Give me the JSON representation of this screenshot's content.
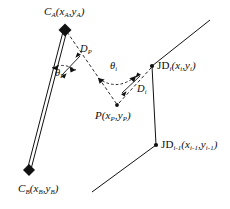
{
  "figure": {
    "type": "geometry-diagram",
    "background_color": "#ffffff",
    "stroke_color": "#111111",
    "labels": {
      "c_a": {
        "symbol": "C",
        "sub": "A",
        "coords": "(x",
        "coord_sub_1": "A",
        "coord_mid": ", y",
        "coord_sub_2": "A",
        "coord_close": ")"
      },
      "c_b": {
        "symbol": "C",
        "sub": "B"
      },
      "p": {
        "symbol": "P",
        "sub": "P"
      },
      "jd_i": {
        "prefix": "JD",
        "sub": "i"
      },
      "jd_i_minus_1": {
        "prefix": "JD",
        "sub": "i-1"
      },
      "d_p": {
        "symbol": "D",
        "sub": "P"
      },
      "d_i": {
        "symbol": "D",
        "sub": "i"
      },
      "theta_p": {
        "symbol": "θ",
        "sub": "P"
      },
      "theta_i": {
        "symbol": "θ",
        "sub": "i"
      }
    },
    "text": {
      "c_a_main": "C",
      "c_a_sub": "A",
      "c_a_open": "(x",
      "c_a_xsub": "A",
      "c_a_comma": ",y",
      "c_a_ysub": "A",
      "c_a_close": ")",
      "c_b_main": "C",
      "c_b_sub": "B",
      "c_b_open": "(x",
      "c_b_xsub": "B",
      "c_b_comma": ",y",
      "c_b_ysub": "B",
      "c_b_close": ")",
      "p_main": "P",
      "p_open": "(x",
      "p_xsub": "P",
      "p_comma": ",y",
      "p_ysub": "P",
      "p_close": ")",
      "jdi_main": "JD",
      "jdi_sub": "i",
      "jdi_open": "(x",
      "jdi_xsub": "i",
      "jdi_comma": ",y",
      "jdi_ysub": "i",
      "jdi_close": ")",
      "jdim1_main": "JD",
      "jdim1_sub": "i-1",
      "jdim1_open": "(x",
      "jdim1_xsub": "i-1",
      "jdim1_comma": ",y",
      "jdim1_ysub": "i-1",
      "jdim1_close": ")",
      "dp_main": "D",
      "dp_sub": "P",
      "di_main": "D",
      "di_sub": "i",
      "thetap_main": "θ",
      "thetap_sub": "P",
      "thetai_main": "θ",
      "thetai_sub": "i"
    },
    "points": {
      "c_a": [
        65,
        30
      ],
      "c_b": [
        29,
        170
      ],
      "p": [
        117,
        105
      ],
      "jd_i": [
        152,
        66
      ],
      "jd_i_minus_1": [
        156,
        145
      ],
      "road_top_end": [
        210,
        20
      ],
      "road_bottom_end": [
        92,
        192
      ]
    }
  }
}
